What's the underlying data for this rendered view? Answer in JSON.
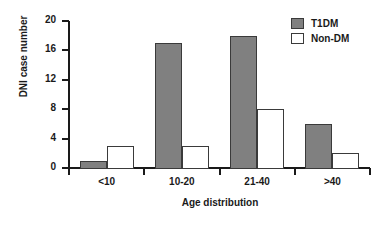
{
  "chart_data": {
    "type": "bar",
    "title": "",
    "xlabel": "Age distribution",
    "ylabel": "DNI case number",
    "categories": [
      "<10",
      "10-20",
      "21-40",
      ">40"
    ],
    "series": [
      {
        "name": "T1DM",
        "values": [
          1,
          17,
          18,
          6
        ],
        "color": "#808080"
      },
      {
        "name": "Non-DM",
        "values": [
          3,
          3,
          8,
          2
        ],
        "color": "#ffffff"
      }
    ],
    "ylim": [
      0,
      20
    ],
    "ytick_step": 4,
    "yticks": [
      0,
      4,
      8,
      12,
      16,
      20
    ],
    "ytick_labels": [
      "0",
      "4",
      "8",
      "12",
      "16",
      "20"
    ],
    "grid": false,
    "legend_position": "top-right",
    "axis_color": "#1a1a1a",
    "bar_border_color": "#3a3a3a",
    "background": "#ffffff"
  },
  "legend": {
    "entries": [
      {
        "label": "T1DM"
      },
      {
        "label": "Non-DM"
      }
    ]
  }
}
